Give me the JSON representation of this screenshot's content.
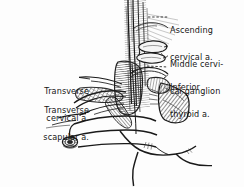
{
  "figure": {
    "kind": "anatomical-line-illustration",
    "background_color": "#fdfdfd",
    "ink_color": "#1a1a1a",
    "width_px": 244,
    "height_px": 187
  },
  "labels": {
    "ascending_cervical": {
      "line1": "Ascending",
      "line2": "cervical a.",
      "side": "right"
    },
    "middle_cervical_ganglion": {
      "line1": "Middle cervi-",
      "line2": "cal ganglion",
      "side": "right"
    },
    "inferior_thyroid": {
      "line1": "Inferior",
      "line2": "thyroid a.",
      "side": "right"
    },
    "transverse_cervical": {
      "line1": "Transverse",
      "line2": "cervical a.",
      "side": "left"
    },
    "transverse_scapular": {
      "line1": "Transverse",
      "line2": "scapular a.",
      "side": "left"
    }
  }
}
